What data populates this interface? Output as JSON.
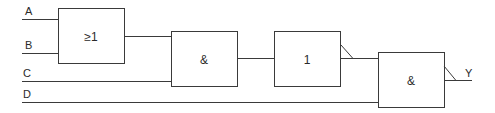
{
  "diagram": {
    "type": "logic-circuit",
    "inputs": [
      {
        "id": "A",
        "label": "A"
      },
      {
        "id": "B",
        "label": "B"
      },
      {
        "id": "C",
        "label": "C"
      },
      {
        "id": "D",
        "label": "D"
      }
    ],
    "gates": [
      {
        "id": "or1",
        "symbol": "≥1",
        "function": "OR",
        "inputs": [
          "A",
          "B"
        ]
      },
      {
        "id": "and1",
        "symbol": "&",
        "function": "AND",
        "inputs": [
          "or1",
          "C"
        ]
      },
      {
        "id": "not1",
        "symbol": "1",
        "function": "NOT",
        "inputs": [
          "and1"
        ],
        "negated_output": true
      },
      {
        "id": "and2",
        "symbol": "&",
        "function": "NAND",
        "inputs": [
          "not1",
          "D"
        ],
        "negated_output": true
      }
    ],
    "output": {
      "id": "Y",
      "label": "Y"
    },
    "colors": {
      "line": "#3a3a3a",
      "background": "#ffffff"
    }
  }
}
